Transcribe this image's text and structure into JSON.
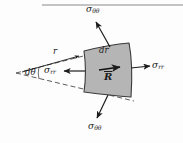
{
  "figure": {
    "name": "polar-stress-element-diagram",
    "background_color": "#fdfdfd",
    "ink_color": "#1c1c1c",
    "element_fill_color": "#b5b5b5",
    "element_stroke_color": "#3a3a3a",
    "top_rule": {
      "present": true,
      "x1": 42,
      "x2": 183,
      "y": 5,
      "color": "#8a8a8a"
    }
  },
  "labels": {
    "sigma_theta_theta_top": {
      "symbol": "σ",
      "subscript": "θθ",
      "x": 88,
      "y": 6
    },
    "sigma_theta_theta_bottom": {
      "symbol": "σ",
      "subscript": "θθ",
      "x": 90,
      "y": 124
    },
    "sigma_rr_left": {
      "symbol": "σ",
      "subscript": "rr",
      "x": 47,
      "y": 71
    },
    "sigma_rr_right": {
      "symbol": "σ",
      "subscript": "rr",
      "x": 152,
      "y": 66
    },
    "radius_r": {
      "symbol": "r",
      "x": 53,
      "y": 50
    },
    "d_theta": {
      "symbol": "dθ",
      "x": 26,
      "y": 70
    },
    "dr": {
      "symbol": "dr",
      "x": 101,
      "y": 50
    },
    "R_vector": {
      "symbol": "R",
      "x": 103,
      "y": 76,
      "has_overbar": true
    }
  },
  "geometry": {
    "wedge_apex": {
      "x": 16,
      "y": 73
    },
    "wedge_upper_ray_end": {
      "x": 131,
      "y": 45
    },
    "wedge_lower_ray_end": {
      "x": 133,
      "y": 100
    },
    "element_corners": [
      {
        "x": 84,
        "y": 51
      },
      {
        "x": 129,
        "y": 43
      },
      {
        "x": 131,
        "y": 97
      },
      {
        "x": 84,
        "y": 92
      }
    ]
  },
  "arrows": {
    "sigma_theta_theta_top": {
      "from": {
        "x": 110,
        "y": 48
      },
      "to": {
        "x": 96,
        "y": 22
      }
    },
    "sigma_theta_theta_bottom": {
      "from": {
        "x": 108,
        "y": 95
      },
      "to": {
        "x": 96,
        "y": 119
      }
    },
    "sigma_rr_left": {
      "from": {
        "x": 84,
        "y": 71
      },
      "to": {
        "x": 64,
        "y": 71
      }
    },
    "sigma_rr_right": {
      "from": {
        "x": 131,
        "y": 68
      },
      "to": {
        "x": 150,
        "y": 66
      }
    },
    "radius_r": {
      "from": {
        "x": 22,
        "y": 72
      },
      "to": {
        "x": 79,
        "y": 55
      }
    },
    "R_vector": {
      "from": {
        "x": 98,
        "y": 70
      },
      "to": {
        "x": 120,
        "y": 67
      }
    }
  }
}
